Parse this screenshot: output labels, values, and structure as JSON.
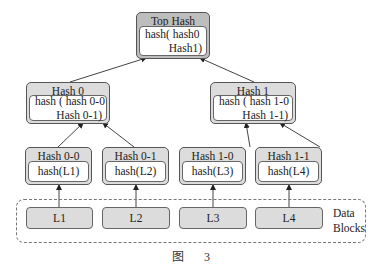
{
  "diagram": {
    "type": "merkle-tree",
    "top": {
      "title": "Top Hash",
      "line1": "hash( hash0",
      "line2": "Hash1)"
    },
    "level1": [
      {
        "title": "Hash 0",
        "line1": "hash ( hash 0-0",
        "line2": "Hash 0-1)"
      },
      {
        "title": "Hash 1",
        "line1": "hash ( hash 1-0",
        "line2": "Hash 1-1)"
      }
    ],
    "level2": [
      {
        "title": "Hash 0-0",
        "body": "hash(L1)"
      },
      {
        "title": "Hash 0-1",
        "body": "hash(L2)"
      },
      {
        "title": "Hash 1-0",
        "body": "hash(L3)"
      },
      {
        "title": "Hash 1-1",
        "body": "hash(L4)"
      }
    ],
    "data_blocks": {
      "label_line1": "Data",
      "label_line2": "Blocks",
      "items": [
        "L1",
        "L2",
        "L3",
        "L4"
      ]
    },
    "caption": {
      "prefix": "图",
      "number": "3"
    },
    "colors": {
      "header_fill": "#dcdcdc",
      "top_header_fill": "#bdbdbd",
      "border": "#555555"
    }
  }
}
